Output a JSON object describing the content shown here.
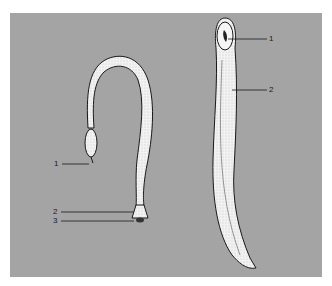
{
  "figure": {
    "background_color": "#a4a4a4",
    "worm_color": "#f2f2f2",
    "outline_color": "#1a1a1a",
    "left_specimen": {
      "labels": [
        {
          "id": "1",
          "text": "1"
        },
        {
          "id": "2",
          "text": "2"
        },
        {
          "id": "3",
          "text": "3"
        }
      ]
    },
    "right_specimen": {
      "labels": [
        {
          "id": "1",
          "text": "1"
        },
        {
          "id": "2",
          "text": "2"
        }
      ]
    }
  }
}
